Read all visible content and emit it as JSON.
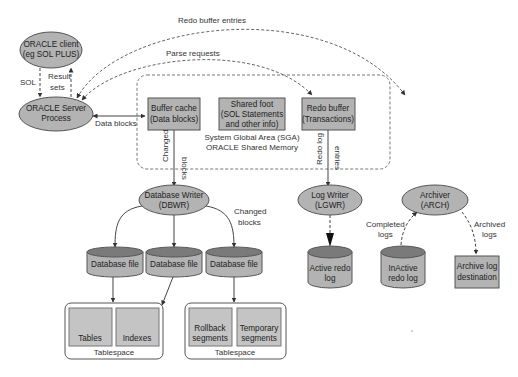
{
  "diagram": {
    "nodes": {
      "oracle_client": [
        "ORACLE client",
        "(eg SOL PLUS)"
      ],
      "server_process": [
        "ORACLE Server",
        "Process"
      ],
      "buffer_cache": [
        "Buffer cache",
        "(Data blocks)"
      ],
      "shared_pool": [
        "Shared foot",
        "(SOL Statements",
        "and other info)"
      ],
      "redo_buffer": [
        "Redo buffer",
        "(Transactions)"
      ],
      "sga_label": [
        "System Global Area (SGA)",
        "ORACLE Shared Memory"
      ],
      "dbwr": [
        "Database Writer",
        "(DBWR)"
      ],
      "lgwr": [
        "Log Writer",
        "(LGWR)"
      ],
      "arch": [
        "Archiver",
        "(ARCH)"
      ],
      "db_file_1": "Database file",
      "db_file_2": "Database file",
      "db_file_3": "Database file",
      "active_redo": [
        "Active redo",
        "log"
      ],
      "inactive_redo": [
        "InActive",
        "redo log"
      ],
      "archive_dest": [
        "Archive log",
        "destination"
      ],
      "tablespace_1": {
        "label": "Tablespace",
        "items": [
          "Tables",
          "Indexes"
        ]
      },
      "tablespace_2": {
        "label": "Tablespace",
        "items": [
          [
            "Rollback",
            "segments"
          ],
          [
            "Temporary",
            "segments"
          ]
        ]
      }
    },
    "edges": {
      "sql": "SOL",
      "result_sets": [
        "Result",
        "sets"
      ],
      "redo_buffer_entries": "Redo buffer entries",
      "parse_requests": "Parse requests",
      "data_blocks": "Data blocks",
      "changed_blocks_vertical": [
        "Changed",
        "blocks"
      ],
      "redo_log_entries": [
        "Redo log",
        "entries"
      ],
      "changed_blocks_right": [
        "Changed",
        "blocks"
      ],
      "completed_logs": [
        "Completed",
        "logs"
      ],
      "archived_logs": [
        "Archived",
        "logs"
      ]
    },
    "colors": {
      "node_fill": "#b3b3b3",
      "node_stroke": "#555555",
      "cylinder_top": "#7a7a7a",
      "line": "#444444",
      "tablespace_item_fill": "#c4c4c4"
    }
  }
}
